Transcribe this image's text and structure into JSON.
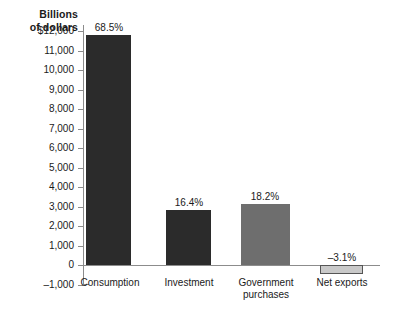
{
  "chart_data": {
    "type": "bar",
    "title": "",
    "subtitle": "",
    "ylabel": "Billions\nof dollars",
    "xlabel": "",
    "categories": [
      "Consumption",
      "Investment",
      "Government\npurchases",
      "Net exports"
    ],
    "values": [
      11800,
      2820,
      3130,
      -450
    ],
    "data_labels": [
      "68.5%",
      "16.4%",
      "18.2%",
      "–3.1%"
    ],
    "series": [
      {
        "name": "Components of GDP",
        "values": [
          11800,
          2820,
          3130,
          -450
        ]
      }
    ],
    "ylim": [
      -1000,
      12500
    ],
    "ytick_values": [
      12000,
      11000,
      10000,
      9000,
      8000,
      7000,
      6000,
      5000,
      4000,
      3000,
      2000,
      1000,
      0,
      -1000
    ],
    "ytick_labels": [
      "$12,000",
      "11,000",
      "10,000",
      "9,000",
      "8,000",
      "7,000",
      "6,000",
      "5,000",
      "4,000",
      "3,000",
      "2,000",
      "1,000",
      "0",
      "–1,000"
    ],
    "grid": false,
    "legend": "none",
    "bar_colors": [
      "#2b2b2b",
      "#2b2b2b",
      "#6e6e6e",
      "#c9c9c9"
    ],
    "axis_color": "#8c8c8c",
    "text_color": "#1a1a1a",
    "background": "#ffffff"
  },
  "axis": {
    "y_title_line1": "Billions",
    "y_title_line2": "of dollars"
  },
  "ticks": [
    {
      "label": "$12,000"
    },
    {
      "label": "11,000"
    },
    {
      "label": "10,000"
    },
    {
      "label": "9,000"
    },
    {
      "label": "8,000"
    },
    {
      "label": "7,000"
    },
    {
      "label": "6,000"
    },
    {
      "label": "5,000"
    },
    {
      "label": "4,000"
    },
    {
      "label": "3,000"
    },
    {
      "label": "2,000"
    },
    {
      "label": "1,000"
    },
    {
      "label": "0"
    },
    {
      "label": "–1,000"
    }
  ],
  "bars": [
    {
      "category": "Consumption",
      "value_label": "68.5%"
    },
    {
      "category": "Investment",
      "value_label": "16.4%"
    },
    {
      "category": "Government\npurchases",
      "value_label": "18.2%"
    },
    {
      "category": "Net exports",
      "value_label": "–3.1%"
    }
  ]
}
